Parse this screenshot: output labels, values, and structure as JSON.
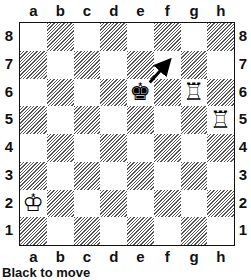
{
  "board": {
    "files": [
      "a",
      "b",
      "c",
      "d",
      "e",
      "f",
      "g",
      "h"
    ],
    "ranks": [
      "8",
      "7",
      "6",
      "5",
      "4",
      "3",
      "2",
      "1"
    ],
    "top_left_square_color": "light",
    "pieces": [
      {
        "square": "e6",
        "piece": "king",
        "color": "black",
        "glyph": "♚"
      },
      {
        "square": "g6",
        "piece": "rook",
        "color": "white",
        "glyph": "♖"
      },
      {
        "square": "h5",
        "piece": "rook",
        "color": "white",
        "glyph": "♖"
      },
      {
        "square": "a2",
        "piece": "king",
        "color": "white",
        "glyph": "♔"
      }
    ],
    "arrows": [
      {
        "from": "e6",
        "to": "f7",
        "icon": "arrow-up-right-icon"
      }
    ]
  },
  "caption": "Black to move"
}
